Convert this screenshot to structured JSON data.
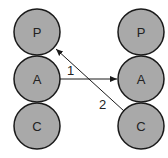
{
  "diagram": {
    "left_column": [
      {
        "id": "left-p",
        "label": "P",
        "cx": 37,
        "cy": 32
      },
      {
        "id": "left-a",
        "label": "A",
        "cx": 37,
        "cy": 79
      },
      {
        "id": "left-c",
        "label": "C",
        "cx": 37,
        "cy": 126
      }
    ],
    "right_column": [
      {
        "id": "right-p",
        "label": "P",
        "cx": 141,
        "cy": 32
      },
      {
        "id": "right-a",
        "label": "A",
        "cx": 141,
        "cy": 79
      },
      {
        "id": "right-c",
        "label": "C",
        "cx": 141,
        "cy": 126
      }
    ],
    "arrows": [
      {
        "id": "arrow-1",
        "label": "1",
        "from": "left-a",
        "to": "right-a"
      },
      {
        "id": "arrow-2",
        "label": "2",
        "from": "right-c",
        "to": "left-p"
      }
    ],
    "colors": {
      "node_fill": "#a9a9a9",
      "stroke": "#1a1a1a",
      "background": "#ffffff"
    }
  }
}
